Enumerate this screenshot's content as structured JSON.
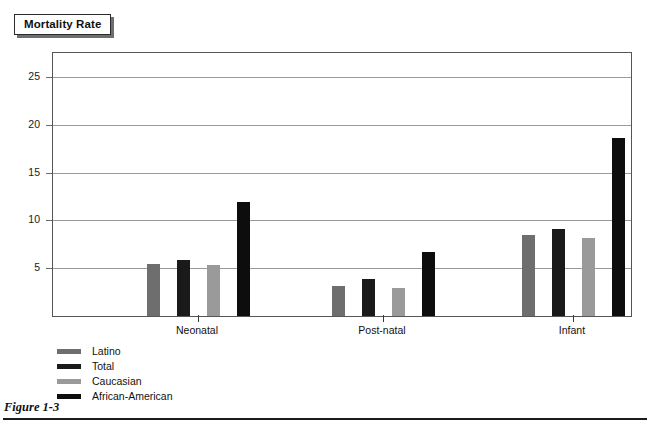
{
  "title": {
    "label": "Mortality Rate"
  },
  "caption": {
    "label": "Figure 1-3"
  },
  "legend": {
    "position": "below-plot-left",
    "items": [
      {
        "label": "Latino",
        "color": "#6e6e6e"
      },
      {
        "label": "Total",
        "color": "#1a1a1a"
      },
      {
        "label": "Caucasian",
        "color": "#9a9a9a"
      },
      {
        "label": "African-American",
        "color": "#0d0d0d"
      }
    ]
  },
  "chart_data": {
    "type": "bar",
    "title": "Mortality Rate",
    "xlabel": "",
    "ylabel": "",
    "ylim": [
      0,
      27.5
    ],
    "yticks": [
      5,
      10,
      15,
      20,
      25
    ],
    "grid": true,
    "categories": [
      "Neonatal",
      "Post-natal",
      "Infant"
    ],
    "series": [
      {
        "name": "Latino",
        "color": "#6e6e6e",
        "values": [
          5.4,
          3.1,
          8.5
        ]
      },
      {
        "name": "Total",
        "color": "#1a1a1a",
        "values": [
          5.9,
          3.9,
          9.1
        ]
      },
      {
        "name": "Caucasian",
        "color": "#9a9a9a",
        "values": [
          5.3,
          2.9,
          8.2
        ]
      },
      {
        "name": "African-American",
        "color": "#0d0d0d",
        "values": [
          11.9,
          6.7,
          18.6
        ]
      }
    ]
  }
}
